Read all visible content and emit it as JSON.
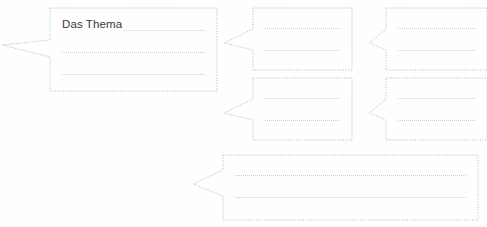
{
  "page": {
    "title": "Das Thema",
    "width": 487,
    "height": 227,
    "background_color": "#fefefe",
    "line_color": "#c9ccd4",
    "border_color": "#b9bcc6",
    "text_color": "#3a3a3c"
  },
  "bubbles": [
    {
      "id": "main-topic-bubble",
      "label": "Das Thema",
      "has_text": true,
      "text_value": "Das Thema",
      "write_lines": 3,
      "x": 50,
      "y": 8,
      "width": 167,
      "height": 83,
      "tail_direction": "left",
      "tail_tip_x": 2,
      "tail_tip_y": 45,
      "tail_top_y": 40,
      "tail_bottom_y": 57
    },
    {
      "id": "branch-bubble-1",
      "label": "",
      "has_text": false,
      "text_value": "",
      "write_lines": 2,
      "x": 253,
      "y": 8,
      "width": 99,
      "height": 62,
      "tail_direction": "left",
      "tail_tip_x": 224,
      "tail_tip_y": 43,
      "tail_top_y": 29,
      "tail_bottom_y": 50
    },
    {
      "id": "branch-bubble-2",
      "label": "",
      "has_text": false,
      "text_value": "",
      "write_lines": 2,
      "x": 386,
      "y": 8,
      "width": 101,
      "height": 62,
      "tail_direction": "left",
      "tail_tip_x": 369,
      "tail_tip_y": 43,
      "tail_top_y": 29,
      "tail_bottom_y": 50
    },
    {
      "id": "branch-bubble-3",
      "label": "",
      "has_text": false,
      "text_value": "",
      "write_lines": 2,
      "x": 253,
      "y": 78,
      "width": 99,
      "height": 62,
      "tail_direction": "left",
      "tail_tip_x": 224,
      "tail_tip_y": 113,
      "tail_top_y": 99,
      "tail_bottom_y": 120
    },
    {
      "id": "branch-bubble-4",
      "label": "",
      "has_text": false,
      "text_value": "",
      "write_lines": 2,
      "x": 386,
      "y": 78,
      "width": 101,
      "height": 62,
      "tail_direction": "left",
      "tail_tip_x": 369,
      "tail_tip_y": 113,
      "tail_top_y": 99,
      "tail_bottom_y": 120
    },
    {
      "id": "branch-bubble-5",
      "label": "",
      "has_text": false,
      "text_value": "",
      "write_lines": 2,
      "x": 223,
      "y": 155,
      "width": 255,
      "height": 65,
      "tail_direction": "left",
      "tail_tip_x": 193,
      "tail_tip_y": 184,
      "tail_top_y": 170,
      "tail_bottom_y": 196
    }
  ]
}
